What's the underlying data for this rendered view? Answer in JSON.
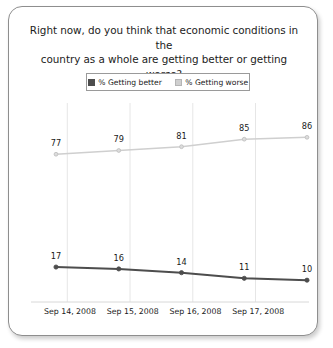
{
  "card": {
    "title": "Right now, do you think that economic conditions in the country as a whole are getting better or getting worse?",
    "title_line1": "Right now, do you think that economic conditions in the",
    "title_line2": "country as a whole are getting better or getting worse?"
  },
  "legend": {
    "entries": [
      {
        "label": "% Getting better",
        "color": "#4d4d4d",
        "swatch_name": "legend-swatch-getting-better"
      },
      {
        "label": "% Getting worse",
        "color": "#cfcfcf",
        "swatch_name": "legend-swatch-getting-worse"
      }
    ]
  },
  "chart_data": {
    "type": "line",
    "title": "Right now, do you think that economic conditions in the country as a whole are getting better or getting worse?",
    "xlabel": "",
    "ylabel": "",
    "ylim": [
      0,
      100
    ],
    "grid": true,
    "grid_axis": "x",
    "legend_position": "top-center",
    "categories": [
      "Sep 14, 2008",
      "Sep 15, 2008",
      "Sep 16, 2008",
      "Sep 17, 2008",
      ""
    ],
    "x_tick_labels": [
      "Sep 14, 2008",
      "Sep 15, 2008",
      "Sep 16, 2008",
      "Sep 17, 2008"
    ],
    "series": [
      {
        "name": "% Getting worse",
        "color": "#cfcfcf",
        "marker": "circle",
        "values": [
          77,
          79,
          81,
          85,
          86
        ],
        "data_labels": [
          "77",
          "79",
          "81",
          "85",
          "86"
        ]
      },
      {
        "name": "% Getting better",
        "color": "#4d4d4d",
        "marker": "circle",
        "values": [
          17,
          16,
          14,
          11,
          10
        ],
        "data_labels": [
          "17",
          "16",
          "14",
          "11",
          "10"
        ]
      }
    ]
  }
}
